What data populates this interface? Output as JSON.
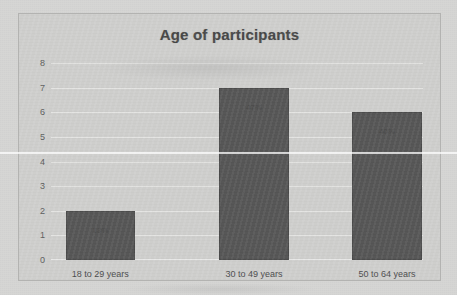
{
  "chart_data": {
    "type": "bar",
    "title": "Age of participants",
    "xlabel": "",
    "ylabel": "",
    "categories": [
      "18 to 29 years",
      "30 to 49 years",
      "50 to 64 years"
    ],
    "values": [
      2,
      7,
      6
    ],
    "data_labels": [
      "13%",
      "47%",
      "40%"
    ],
    "ylim": [
      0,
      8
    ],
    "yticks": [
      0,
      1,
      2,
      3,
      4,
      5,
      6,
      7,
      8
    ],
    "ytick_labels": [
      "0",
      "1",
      "2",
      "3",
      "4",
      "5",
      "6",
      "7",
      "8"
    ],
    "grid": true,
    "legend": false,
    "legend_position": "none",
    "series": [
      {
        "name": "Age of participants",
        "values": [
          2,
          7,
          6
        ],
        "color": "#565656"
      }
    ]
  },
  "colors": {
    "bar": "#565656",
    "bar_border": "#4a4a4a",
    "plot_background": "#cfcfcd",
    "page_background": "#d6d6d4",
    "gridline": "#ffffff",
    "title_text": "#474747",
    "tick_text": "#5c5c5c",
    "label_text": "#4d4d4d"
  }
}
